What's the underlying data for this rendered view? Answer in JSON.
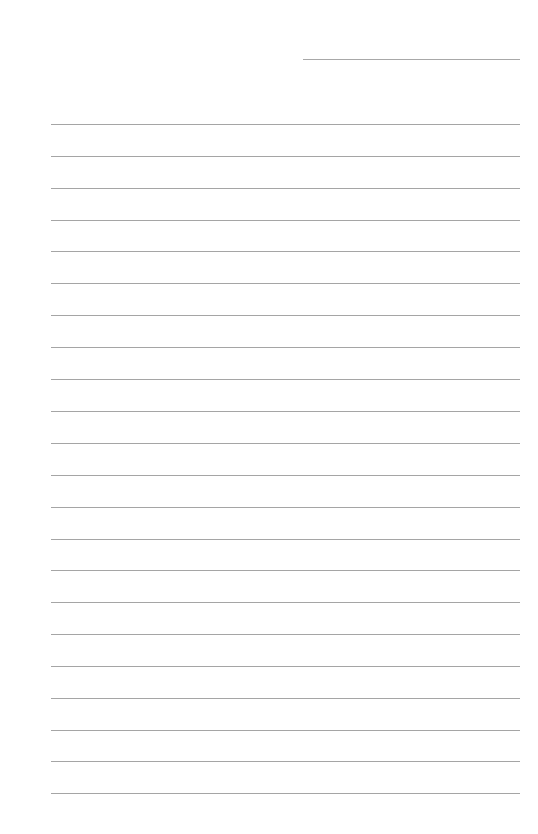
{
  "page": {
    "type": "lined-paper",
    "background_color": "#ffffff",
    "line_color": "#a5a5a5",
    "header_line": {
      "x": 303,
      "y": 59,
      "width": 217
    },
    "ruled_lines": {
      "x": 51,
      "width": 469,
      "count": 22,
      "positions_y": [
        124,
        156,
        188,
        220,
        251,
        283,
        315,
        347,
        379,
        411,
        443,
        475,
        507,
        539,
        570,
        602,
        634,
        666,
        698,
        730,
        761,
        793
      ]
    }
  }
}
